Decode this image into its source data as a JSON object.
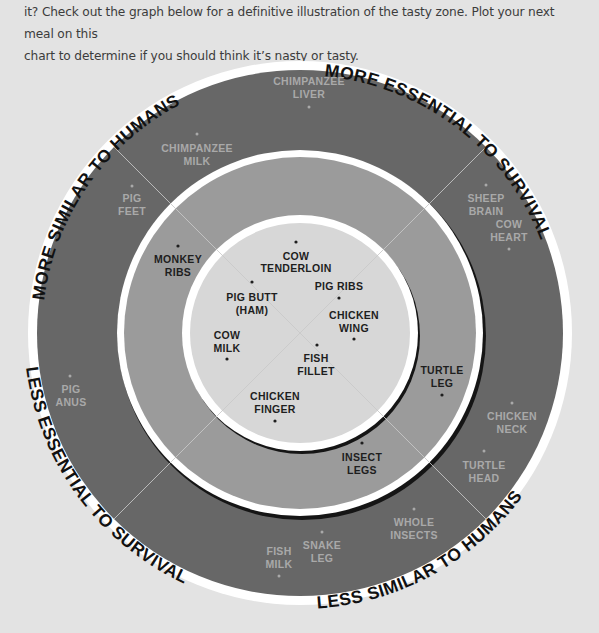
{
  "intro": {
    "line1": "it? Check out the graph below for a definitive illustration of the tasty zone. Plot your next meal on this",
    "line2": "chart to determine if you should think it’s nasty or tasty."
  },
  "axes": {
    "top_left": "MORE SIMILAR TO HUMANS",
    "top_right": "MORE ESSENTIAL TO SURVIVAL",
    "bottom_right": "LESS SIMILAR TO HUMANS",
    "bottom_left": "LESS ESSENTIAL TO SURVIVAL"
  },
  "colors": {
    "background": "#e3e3e3",
    "outer_ring": "#676767",
    "middle_ring": "#9b9b9b",
    "inner_circle": "#d7d7d7",
    "ring_border": "#ffffff",
    "outer_label": "#a9a9a9",
    "inner_label": "#1e1e1e"
  },
  "rings": {
    "outer": {
      "zone": "nasty",
      "items": [
        {
          "label": "CHIMPANZEE",
          "label2": "LIVER"
        },
        {
          "label": "CHIMPANZEE",
          "label2": "MILK"
        },
        {
          "label": "PIG",
          "label2": "FEET"
        },
        {
          "label": "SHEEP",
          "label2": "BRAIN"
        },
        {
          "label": "COW",
          "label2": "HEART"
        },
        {
          "label": "PIG",
          "label2": "ANUS"
        },
        {
          "label": "CHICKEN",
          "label2": "NECK"
        },
        {
          "label": "TURTLE",
          "label2": "HEAD"
        },
        {
          "label": "WHOLE",
          "label2": "INSECTS"
        },
        {
          "label": "SNAKE",
          "label2": "LEG"
        },
        {
          "label": "FISH",
          "label2": "MILK"
        }
      ]
    },
    "middle": {
      "items": [
        {
          "label": "MONKEY",
          "label2": "RIBS"
        },
        {
          "label": "TURTLE",
          "label2": "LEG"
        },
        {
          "label": "INSECT",
          "label2": "LEGS"
        }
      ]
    },
    "inner": {
      "zone": "tasty",
      "items": [
        {
          "label": "COW",
          "label2": "TENDERLOIN"
        },
        {
          "label": "PIG RIBS",
          "label2": ""
        },
        {
          "label": "PIG BUTT",
          "label2": "(HAM)"
        },
        {
          "label": "CHICKEN",
          "label2": "WING"
        },
        {
          "label": "COW",
          "label2": "MILK"
        },
        {
          "label": "FISH",
          "label2": "FILLET"
        },
        {
          "label": "CHICKEN",
          "label2": "FINGER"
        }
      ]
    }
  }
}
